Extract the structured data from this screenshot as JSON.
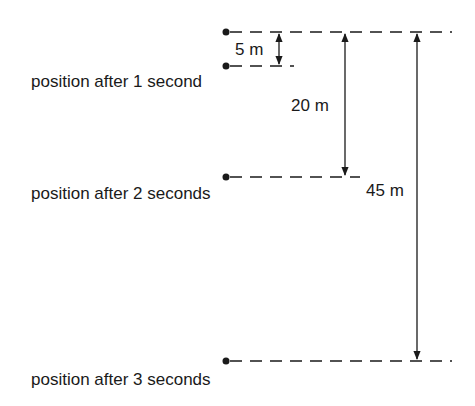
{
  "diagram": {
    "type": "free-fall-positions",
    "positions": [
      {
        "label": "",
        "y": 32
      },
      {
        "label": "position after 1 second",
        "y": 66
      },
      {
        "label": "position after 2 seconds",
        "y": 177
      },
      {
        "label": "position after 3 seconds",
        "y": 361
      }
    ],
    "distances": [
      {
        "label": "5 m",
        "from": "start",
        "to": "1 second"
      },
      {
        "label": "20 m",
        "from": "start",
        "to": "2 seconds"
      },
      {
        "label": "45 m",
        "from": "start",
        "to": "3 seconds"
      }
    ],
    "colors": {
      "ink": "#1a1a1a",
      "background": "#ffffff"
    }
  }
}
